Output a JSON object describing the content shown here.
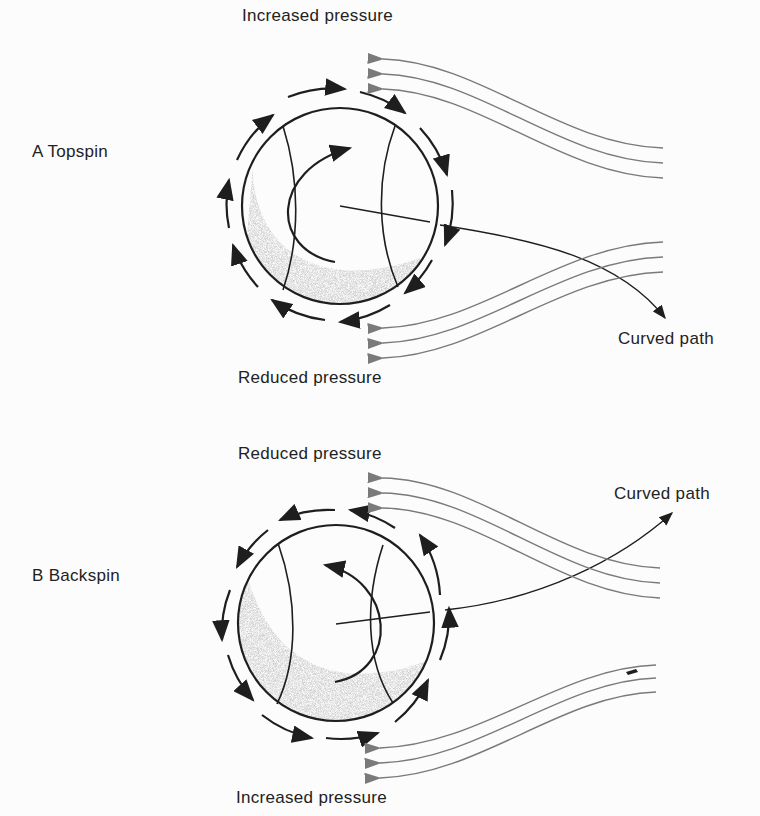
{
  "panels": [
    {
      "id": "A",
      "label": "A  Topspin",
      "top_label": "Increased pressure",
      "bottom_label": "Reduced pressure",
      "path_label": "Curved path"
    },
    {
      "id": "B",
      "label": "B  Backspin",
      "top_label": "Reduced pressure",
      "bottom_label": "Increased pressure",
      "path_label": "Curved path"
    }
  ],
  "colors": {
    "ink": "#1e1e1e",
    "flow": "#7a7a7a",
    "shade": "#555555"
  }
}
